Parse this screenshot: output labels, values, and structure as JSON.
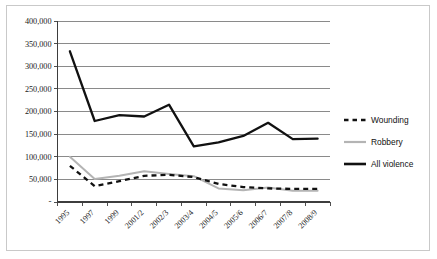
{
  "chart_data": {
    "type": "line",
    "title": "",
    "subtitle": "",
    "xlabel": "",
    "ylabel": "",
    "ylim": [
      0,
      400000
    ],
    "ytick_values": [
      0,
      50000,
      100000,
      150000,
      200000,
      250000,
      300000,
      350000,
      400000
    ],
    "ytick_labels": [
      "-",
      "50,000",
      "100,000",
      "150,000",
      "200,000",
      "250,000",
      "300,000",
      "350,000",
      "400,000"
    ],
    "grid": true,
    "legend_position": "right",
    "categories": [
      "1995",
      "1997",
      "1999",
      "2001/2",
      "2002/3",
      "2003/4",
      "2004/5",
      "2005/6",
      "2006/7",
      "2007/8",
      "2008/9"
    ],
    "series": [
      {
        "name": "Wounding",
        "style": "dashed",
        "color": "#111111",
        "values": [
          80000,
          35000,
          46000,
          58000,
          60000,
          55000,
          40000,
          33000,
          30000,
          29000,
          29000
        ]
      },
      {
        "name": "Robbery",
        "style": "solid",
        "color": "#b4b4b4",
        "values": [
          100000,
          51000,
          58000,
          68000,
          62000,
          57000,
          30000,
          26000,
          32000,
          25000,
          25000
        ]
      },
      {
        "name": "All violence",
        "style": "solid-thick",
        "color": "#111111",
        "values": [
          333000,
          179000,
          192000,
          189000,
          215000,
          123000,
          132000,
          146000,
          175000,
          139000,
          140000
        ]
      }
    ]
  },
  "legend": {
    "entries": [
      {
        "label": "Wounding"
      },
      {
        "label": "Robbery"
      },
      {
        "label": "All violence"
      }
    ]
  },
  "colors": {
    "all_violence": "#111111",
    "robbery": "#b4b4b4",
    "wounding": "#111111",
    "gridline": "#7d7d7d",
    "frame": "#c9c9c9",
    "background": "#ffffff"
  }
}
